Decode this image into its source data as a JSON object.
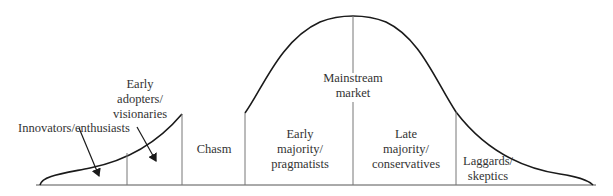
{
  "diagram": {
    "segments": [
      {
        "id": "innovators",
        "label": "Innovators/enthusiasts"
      },
      {
        "id": "early-adopters",
        "label_lines": [
          "Early",
          "adopters/",
          "visionaries"
        ]
      },
      {
        "id": "chasm",
        "label": "Chasm"
      },
      {
        "id": "early-majority",
        "label_lines": [
          "Early",
          "majority/",
          "pragmatists"
        ]
      },
      {
        "id": "late-majority",
        "label_lines": [
          "Late",
          "majority/",
          "conservatives"
        ]
      },
      {
        "id": "laggards",
        "label_lines": [
          "Laggards/",
          "skeptics"
        ]
      }
    ],
    "mainstream": {
      "label_lines": [
        "Mainstream",
        "market"
      ]
    },
    "colors": {
      "curve": "#1a1a1a",
      "divider": "#777777",
      "text": "#333333"
    }
  }
}
